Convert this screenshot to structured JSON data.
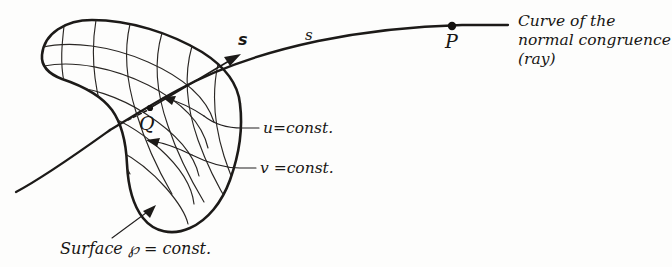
{
  "figure": {
    "background_color": "#fdfdfc",
    "ink_color": "#1c1a18",
    "style": "hand-drawn pen-and-ink technical diagram"
  },
  "labels": {
    "point_q": "Q",
    "point_p": "P",
    "tangent_vector": "s",
    "arc_length": "s",
    "u_const": "u=const.",
    "v_const": "v =const.",
    "surface_caption_prefix": "Surface",
    "surface_symbol": "℘",
    "surface_caption_suffix": "= const.",
    "surface_caption_full": "Surface ℘ = const.",
    "note_line_1": "Curve of the",
    "note_line_2": "normal congruence",
    "note_line_3": "(ray)"
  },
  "annotations": {
    "surface_name": "curved surface patch with u-v coordinate grid",
    "ray_name": "curve of the normal congruence (ray)",
    "q_description": "intersection point of the ray with the surface",
    "p_description": "point further along the ray",
    "vector_description": "unit tangent vector of the ray at Q"
  }
}
